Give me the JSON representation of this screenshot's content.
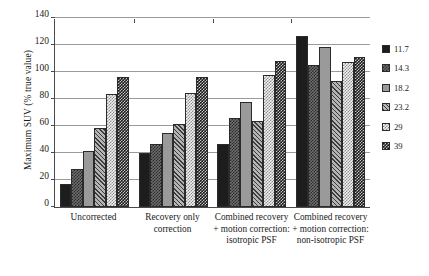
{
  "chart_data": {
    "type": "bar",
    "title": "",
    "subtitle": "",
    "xlabel": "",
    "ylabel": "Maximum SUV (% true value)",
    "ylim": [
      0,
      140
    ],
    "yticks": [
      0,
      20,
      40,
      60,
      80,
      100,
      120,
      140
    ],
    "grid": true,
    "legend_position": "right",
    "legend_title": "",
    "categories": [
      "Uncorrected",
      "Recovery only correction",
      "Combined recovery + motion correction: isotropic PSF",
      "Combined recovery + motion correction: non-isotropic PSF"
    ],
    "series": [
      {
        "name": "11.7",
        "values": [
          17,
          40,
          47,
          127
        ]
      },
      {
        "name": "14.3",
        "values": [
          28,
          47,
          66,
          106
        ]
      },
      {
        "name": "18.2",
        "values": [
          42,
          55,
          78,
          119
        ]
      },
      {
        "name": "23.2",
        "values": [
          59,
          62,
          64,
          94
        ]
      },
      {
        "name": "29",
        "values": [
          84,
          85,
          98,
          108
        ]
      },
      {
        "name": "39",
        "values": [
          97,
          97,
          109,
          112
        ]
      }
    ]
  }
}
